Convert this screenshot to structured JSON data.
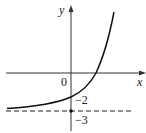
{
  "diagram": {
    "type": "function-graph",
    "axes": {
      "x_label": "x",
      "y_label": "y",
      "origin_label": "0"
    },
    "annotations": {
      "y_intercept_label": "−2",
      "asymptote_label": "−3"
    },
    "function": {
      "description": "increasing exponential curve with horizontal asymptote y = -3, y-intercept -2",
      "asymptote_y": -3,
      "y_intercept": -2
    },
    "colors": {
      "curve": "#111111",
      "axes": "#333333",
      "asymptote": "#222222"
    }
  }
}
